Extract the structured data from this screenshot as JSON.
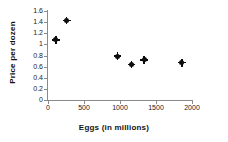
{
  "chart_data": {
    "type": "scatter",
    "title": "",
    "xlabel": "Eggs (in millions)",
    "ylabel": "Price per dozen",
    "xlim": [
      0,
      2000
    ],
    "ylim": [
      0,
      1.6
    ],
    "grid": false,
    "legend": false,
    "xticks": [
      0,
      500,
      1000,
      1500,
      2000
    ],
    "xtick_labels": [
      "0",
      "500",
      "1000",
      "1500",
      "2000"
    ],
    "yticks": [
      0,
      0.2,
      0.4,
      0.6,
      0.8,
      1,
      1.2,
      1.4,
      1.6
    ],
    "ytick_labels": [
      "0",
      "0.2",
      "0.4",
      "0.6",
      "0.8",
      "1",
      "1.2",
      "1.4",
      "1.6"
    ],
    "marker": "diamond",
    "marker_color": "#0d0d0d",
    "axis_color": "#8a8a8a",
    "points": [
      {
        "x": 110,
        "y": 1.08
      },
      {
        "x": 260,
        "y": 1.43
      },
      {
        "x": 965,
        "y": 0.79
      },
      {
        "x": 1160,
        "y": 0.64
      },
      {
        "x": 1335,
        "y": 0.72
      },
      {
        "x": 1860,
        "y": 0.67
      }
    ]
  }
}
